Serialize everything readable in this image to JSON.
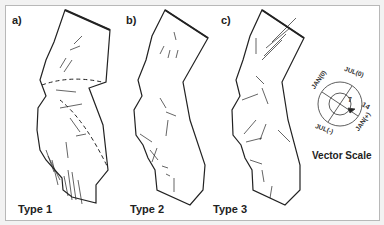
{
  "figure": {
    "panels": [
      {
        "label": "a)",
        "type_label": "Type 1"
      },
      {
        "label": "b)",
        "type_label": "Type 2"
      },
      {
        "label": "c)",
        "type_label": "Type 3"
      }
    ],
    "vector_scale": {
      "title": "Vector Scale",
      "labels": {
        "top_right": "JUL(0)",
        "top_left": "JAN(0)",
        "bottom_left": "JUL(-)",
        "bottom_right": "JAN(+)",
        "inner": "7",
        "outer": "14"
      }
    },
    "colors": {
      "line": "#222222",
      "background": "#ffffff",
      "frame": "#b8b8b8"
    }
  }
}
